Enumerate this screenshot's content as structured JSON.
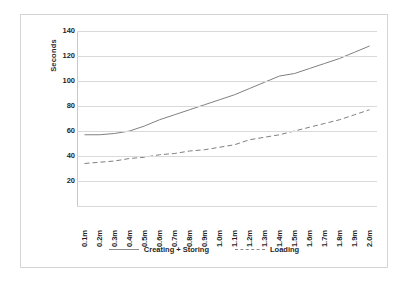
{
  "chart_data": {
    "type": "line",
    "title": "",
    "xlabel": "",
    "ylabel": "Seconds",
    "ylim": [
      0,
      140
    ],
    "grid": true,
    "legend_position": "bottom",
    "categories": [
      "0.1m",
      "0.2m",
      "0.3m",
      "0.4m",
      "0.5m",
      "0.6m",
      "0.7m",
      "0.8m",
      "0.9m",
      "1.0m",
      "1.1m",
      "1.2m",
      "1.3m",
      "1.4m",
      "1.5m",
      "1.6m",
      "1.7m",
      "1.8m",
      "1.9m",
      "2.0m"
    ],
    "y_ticks": [
      20,
      40,
      60,
      80,
      100,
      120,
      140
    ],
    "series": [
      {
        "name": "Creating + Storing",
        "style": "solid",
        "color": "#808080",
        "values": [
          57,
          57,
          58,
          60,
          64,
          69,
          73,
          77,
          81,
          85,
          89,
          94,
          99,
          104,
          106,
          110,
          114,
          118,
          123,
          128
        ]
      },
      {
        "name": "Loading",
        "style": "dashed",
        "color": "#808080",
        "values": [
          34,
          35,
          36,
          38,
          39,
          41,
          42,
          44,
          45,
          47,
          49,
          53,
          55,
          57,
          60,
          63,
          66,
          69,
          73,
          77
        ]
      }
    ]
  },
  "legend": {
    "items": [
      {
        "label": "Creating + Storing",
        "style": "solid"
      },
      {
        "label": "Loading",
        "style": "dashed"
      }
    ]
  }
}
